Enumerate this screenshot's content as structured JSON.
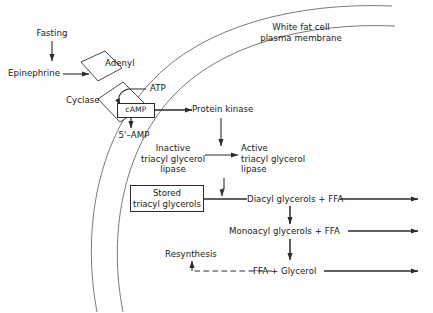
{
  "diagram": {
    "membrane_label": "White fat cell\nplasma membrane",
    "membrane_label_line1": "White fat cell",
    "membrane_label_line2": "plasma membrane",
    "colors": {
      "stroke": "#2b2b2b",
      "membrane": "#5a5a5a",
      "text": "#1a1a1a",
      "background": "#fefefe"
    },
    "nodes": {
      "fasting": "Fasting",
      "epinephrine": "Epinephrine",
      "adenyl": "Adenyl",
      "cyclase": "Cyclase",
      "atp": "ATP",
      "camp": "cAMP",
      "amp5": "5'–AMP",
      "protein_kinase": "Protein kinase",
      "inactive_lipase_l1": "Inactive",
      "inactive_lipase_l2": "triacyl glycerol",
      "inactive_lipase_l3": "lipase",
      "active_lipase_l1": "Active",
      "active_lipase_l2": "triacyl glycerol",
      "active_lipase_l3": "lipase",
      "stored_l1": "Stored",
      "stored_l2": "triacyl glycerols",
      "diacyl": "Diacyl glycerols + FFA",
      "monoacyl": "Monoacyl glycerols + FFA",
      "ffa_glycerol": "FFA + Glycerol",
      "resynthesis": "Resynthesis"
    }
  }
}
